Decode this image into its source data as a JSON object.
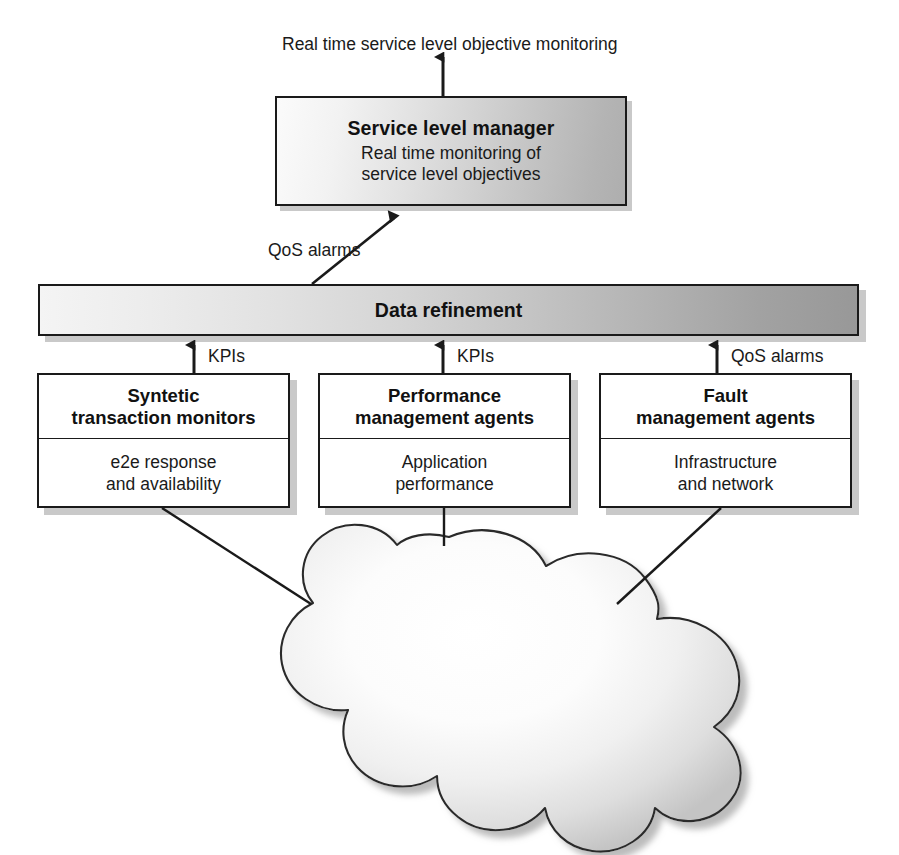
{
  "diagram": {
    "top_output_label": "Real time service level objective monitoring",
    "nodes": {
      "service_level_manager": {
        "title": "Service level manager",
        "subtitle_line1": "Real time monitoring of",
        "subtitle_line2": "service level objectives"
      },
      "data_refinement": {
        "label": "Data refinement"
      },
      "synthetic_monitors": {
        "title_line1": "Syntetic",
        "title_line2": "transaction monitors",
        "body_line1": "e2e response",
        "body_line2": "and availability"
      },
      "performance_agents": {
        "title_line1": "Performance",
        "title_line2": "management agents",
        "body_line1": "Application",
        "body_line2": "performance"
      },
      "fault_agents": {
        "title_line1": "Fault",
        "title_line2": "management agents",
        "body_line1": "Infrastructure",
        "body_line2": "and network"
      },
      "service_network": {
        "label_line1": "Service",
        "label_line2": "network"
      }
    },
    "edge_labels": {
      "qos_alarms_to_slm": "QoS alarms",
      "kpis_from_synthetic": "KPIs",
      "kpis_from_performance": "KPIs",
      "qos_alarms_from_fault": "QoS alarms"
    },
    "colors": {
      "stroke": "#1a1a1a",
      "background": "#ffffff",
      "box_fill": "#ffffff",
      "shadow": "#c9c9c9",
      "gradient_light": "#f6f6f6",
      "gradient_dark": "#989898",
      "text": "#1a1a1a"
    }
  }
}
